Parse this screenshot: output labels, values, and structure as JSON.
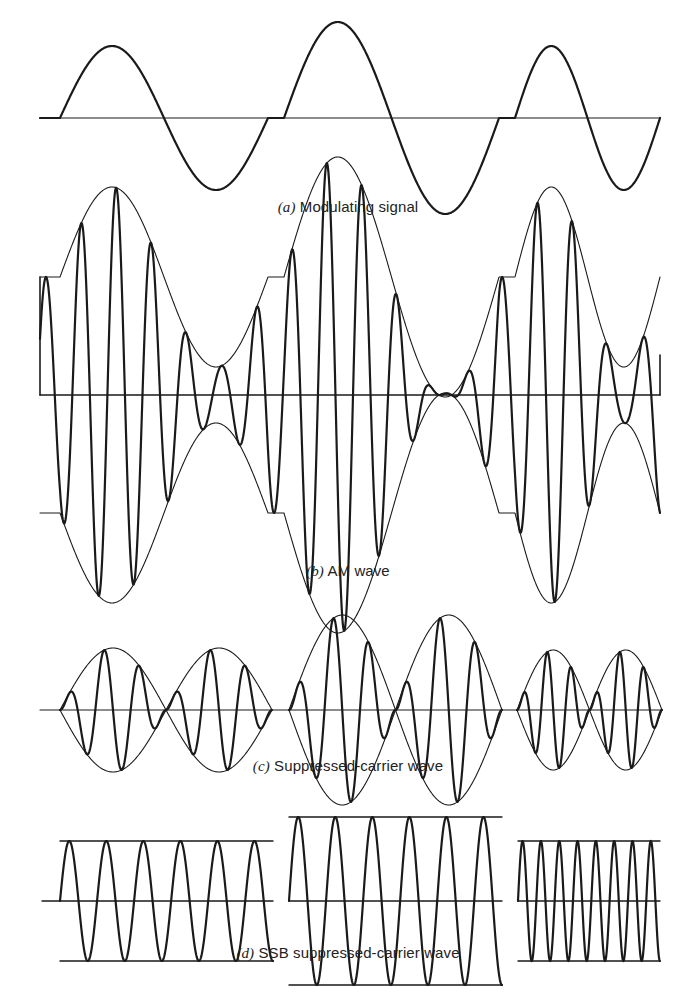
{
  "figure": {
    "stroke_color": "#1a1a1a",
    "panels": [
      {
        "id": "a",
        "tag": "(a)",
        "caption": "Modulating signal",
        "caption_y": 198,
        "axis_y": 118,
        "axis_x": [
          40,
          660
        ],
        "segments": [
          {
            "x0": 60,
            "x1": 268,
            "amp": 72
          },
          {
            "x0": 284,
            "x1": 499,
            "amp": 96
          },
          {
            "x0": 515,
            "x1": 660,
            "amp": 72
          }
        ]
      },
      {
        "id": "b",
        "tag": "(b)",
        "caption": "AM wave",
        "caption_y": 562,
        "axis_y": 395,
        "axis_x": [
          40,
          660
        ],
        "carrier_offset": 118,
        "carrier_cycles_per_px": 0.0285
      },
      {
        "id": "c",
        "tag": "(c)",
        "caption": "Suppressed-carrier wave",
        "caption_y": 757,
        "axis_y": 710,
        "axis_x": [
          40,
          662
        ],
        "segments": [
          {
            "x0": 60,
            "x1": 272,
            "amp": 62
          },
          {
            "x0": 289,
            "x1": 502,
            "amp": 95
          },
          {
            "x0": 517,
            "x1": 662,
            "amp": 60
          }
        ]
      },
      {
        "id": "d",
        "tag": "(d)",
        "caption": "SSB suppressed-carrier wave",
        "caption_y": 944,
        "axis_y": 901,
        "segments": [
          {
            "x0": 60,
            "x1": 273,
            "amp": 60,
            "cycles": 5.75,
            "line_x": [
              42,
              273
            ]
          },
          {
            "x0": 289,
            "x1": 502,
            "amp": 84,
            "cycles": 5.75,
            "line_x": [
              289,
              502
            ]
          },
          {
            "x0": 518,
            "x1": 660,
            "amp": 60,
            "cycles": 7.75,
            "line_x": [
              518,
              660
            ]
          }
        ]
      }
    ]
  }
}
